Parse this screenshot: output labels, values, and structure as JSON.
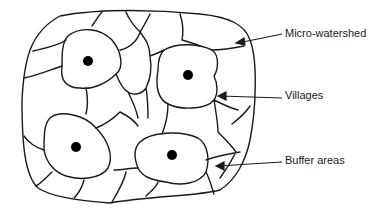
{
  "diagram": {
    "type": "micro-watershed layout",
    "labels": {
      "micro_watershed": "Micro-watershed",
      "villages": "Villages",
      "buffer_areas": "Buffer areas"
    },
    "colors": {
      "line": "#1a1a1a",
      "background": "#ffffff",
      "dot": "#000000"
    },
    "village_count": 4
  }
}
